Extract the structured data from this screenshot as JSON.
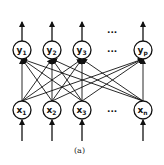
{
  "diagram": {
    "caption": "(a)",
    "output_layer": {
      "nodes": [
        {
          "name": "y",
          "sub": "1",
          "cx": 22
        },
        {
          "name": "y",
          "sub": "2",
          "cx": 52
        },
        {
          "name": "y",
          "sub": "3",
          "cx": 82
        },
        {
          "name": "y",
          "sub": "p",
          "cx": 143
        }
      ],
      "ellipsis": "...",
      "cy": 50
    },
    "input_layer": {
      "nodes": [
        {
          "name": "x",
          "sub": "1",
          "cx": 22
        },
        {
          "name": "x",
          "sub": "2",
          "cx": 52
        },
        {
          "name": "x",
          "sub": "3",
          "cx": 82
        },
        {
          "name": "x",
          "sub": "n",
          "cx": 143
        }
      ],
      "ellipsis": "...",
      "cy": 110
    },
    "connections": "fully-connected",
    "colors": {
      "stroke": "#111111",
      "background": "#ffffff"
    }
  }
}
